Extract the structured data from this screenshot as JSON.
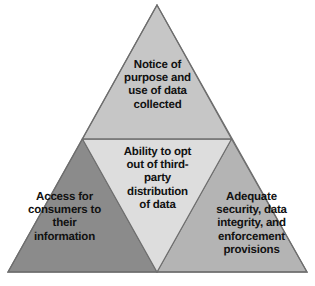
{
  "diagram": {
    "type": "triangle-subdivision",
    "shape": "equilateral-triangle",
    "background_color": "#ffffff",
    "outline_color": "#6e6e6e",
    "text_color": "#111111",
    "sections": [
      {
        "id": "top",
        "position": "apex",
        "label": "Notice of\npurpose and\nuse of data\ncollected",
        "fill_color": "#c6c6c6"
      },
      {
        "id": "middle",
        "position": "center-inverted",
        "label": "Ability to opt\nout of third-\nparty\ndistribution\nof data",
        "fill_color": "#dddddd"
      },
      {
        "id": "bottom-left",
        "position": "bottom-left",
        "label": "Access for\nconsumers to\ntheir\ninformation",
        "fill_color": "#8b8b8b"
      },
      {
        "id": "bottom-right",
        "position": "bottom-right",
        "label": "Adequate\nsecurity, data\nintegrity, and\nenforcement\nprovisions",
        "fill_color": "#b4b4b4"
      }
    ]
  }
}
